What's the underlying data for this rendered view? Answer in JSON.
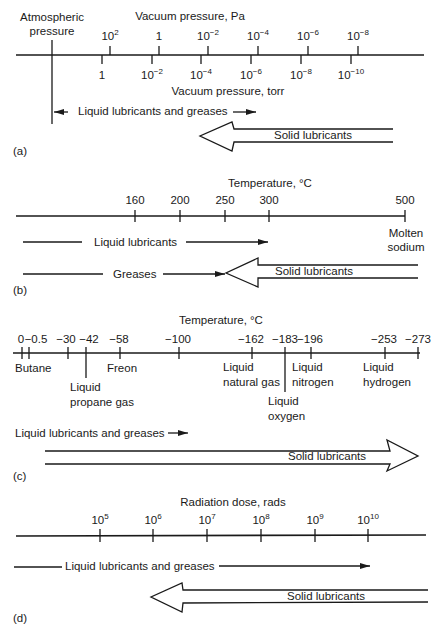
{
  "panels": {
    "a": {
      "tag": "(a)",
      "top_axis_title": "Vacuum pressure, Pa",
      "bottom_axis_title": "Vacuum pressure, torr",
      "atmospheric_label": "Atmospheric\npressure",
      "pa_ticks": [
        {
          "base": "10",
          "exp": "2"
        },
        {
          "base": "1",
          "exp": ""
        },
        {
          "base": "10",
          "exp": "−2"
        },
        {
          "base": "10",
          "exp": "−4"
        },
        {
          "base": "10",
          "exp": "−6"
        },
        {
          "base": "10",
          "exp": "−8"
        }
      ],
      "torr_ticks": [
        {
          "base": "1",
          "exp": ""
        },
        {
          "base": "10",
          "exp": "−2"
        },
        {
          "base": "10",
          "exp": "−4"
        },
        {
          "base": "10",
          "exp": "−6"
        },
        {
          "base": "10",
          "exp": "−8"
        },
        {
          "base": "10",
          "exp": "−10"
        }
      ],
      "liquid_label": "Liquid lubricants and greases",
      "solid_label": "Solid lubricants"
    },
    "b": {
      "tag": "(b)",
      "axis_title": "Temperature, °C",
      "ticks": [
        "160",
        "200",
        "250",
        "300",
        "500"
      ],
      "end_label": "Molten\nsodium",
      "liquid_label": "Liquid lubricants",
      "greases_label": "Greases",
      "solid_label": "Solid lubricants"
    },
    "c": {
      "tag": "(c)",
      "axis_title": "Temperature, °C",
      "ticks": [
        "0",
        "−0.5",
        "−30",
        "−42",
        "−58",
        "−100",
        "−162",
        "−183",
        "−196",
        "−253",
        "−273"
      ],
      "substances": {
        "butane": "Butane",
        "propane": "Liquid\npropane gas",
        "freon": "Freon",
        "natural_gas": "Liquid\nnatural gas",
        "oxygen": "Liquid\noxygen",
        "nitrogen": "Liquid\nnitrogen",
        "hydrogen": "Liquid\nhydrogen"
      },
      "liquid_label": "Liquid lubricants and greases",
      "solid_label": "Solid lubricants"
    },
    "d": {
      "tag": "(d)",
      "axis_title": "Radiation dose, rads",
      "ticks": [
        {
          "base": "10",
          "exp": "5"
        },
        {
          "base": "10",
          "exp": "6"
        },
        {
          "base": "10",
          "exp": "7"
        },
        {
          "base": "10",
          "exp": "8"
        },
        {
          "base": "10",
          "exp": "9"
        },
        {
          "base": "10",
          "exp": "10"
        }
      ],
      "liquid_label": "Liquid lubricants and greases",
      "solid_label": "Solid lubricants"
    }
  },
  "colors": {
    "ink": "#1a1a1a",
    "background": "#ffffff"
  }
}
